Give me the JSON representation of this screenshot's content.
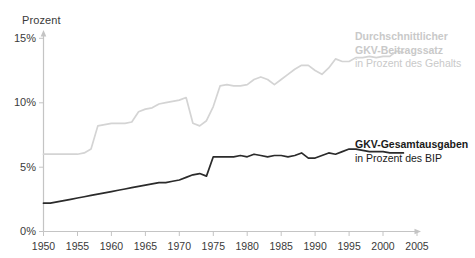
{
  "axes": {
    "y_unit_label": "Prozent",
    "y_ticks": [
      "15%",
      "10%",
      "5%",
      "0%"
    ],
    "x_ticks": [
      "1950",
      "1955",
      "1960",
      "1965",
      "1970",
      "1975",
      "1980",
      "1985",
      "1990",
      "1995",
      "2000",
      "2005"
    ]
  },
  "legend": {
    "gray": {
      "line1": "Durchschnittlicher",
      "line2": "GKV-Beitragssatz",
      "line3": "in Prozent des Gehalts"
    },
    "black": {
      "line1": "GKV-Gesamtausgaben",
      "line2": "in Prozent des BIP"
    }
  },
  "colors": {
    "gray_series": "#d4d4d4",
    "black_series": "#2b2b2b",
    "axis": "#c4c4c4",
    "text": "#3a3a3a"
  },
  "chart_data": {
    "type": "line",
    "title": "",
    "xlabel": "",
    "ylabel": "Prozent",
    "xlim": [
      1950,
      2005
    ],
    "ylim": [
      0,
      15
    ],
    "grid": false,
    "legend_position": "right",
    "x": [
      1950,
      1951,
      1952,
      1953,
      1954,
      1955,
      1956,
      1957,
      1958,
      1959,
      1960,
      1961,
      1962,
      1963,
      1964,
      1965,
      1966,
      1967,
      1968,
      1969,
      1970,
      1971,
      1972,
      1973,
      1974,
      1975,
      1976,
      1977,
      1978,
      1979,
      1980,
      1981,
      1982,
      1983,
      1984,
      1985,
      1986,
      1987,
      1988,
      1989,
      1990,
      1991,
      1992,
      1993,
      1994,
      1995,
      1996,
      1997,
      1998,
      1999,
      2000,
      2001,
      2002,
      2003
    ],
    "series": [
      {
        "name": "Durchschnittlicher GKV-Beitragssatz in Prozent des Gehalts",
        "color": "#d4d4d4",
        "units": "Prozent des Gehalts",
        "values": [
          6.0,
          6.0,
          6.0,
          6.0,
          6.0,
          6.0,
          6.1,
          6.4,
          8.2,
          8.3,
          8.4,
          8.4,
          8.4,
          8.5,
          9.3,
          9.5,
          9.6,
          9.9,
          10.0,
          10.1,
          10.2,
          10.4,
          8.4,
          8.2,
          8.6,
          9.7,
          11.3,
          11.4,
          11.3,
          11.3,
          11.4,
          11.8,
          12.0,
          11.8,
          11.4,
          11.8,
          12.2,
          12.6,
          12.9,
          12.9,
          12.5,
          12.2,
          12.7,
          13.4,
          13.2,
          13.2,
          13.5,
          13.5,
          13.6,
          13.5,
          13.6,
          13.6,
          14.0,
          13.9
        ]
      },
      {
        "name": "GKV-Gesamtausgaben in Prozent des BIP",
        "color": "#2b2b2b",
        "units": "Prozent des BIP",
        "values": [
          2.2,
          2.2,
          2.3,
          2.4,
          2.5,
          2.6,
          2.7,
          2.8,
          2.9,
          3.0,
          3.1,
          3.2,
          3.3,
          3.4,
          3.5,
          3.6,
          3.7,
          3.8,
          3.8,
          3.9,
          4.0,
          4.2,
          4.4,
          4.5,
          4.3,
          5.8,
          5.8,
          5.8,
          5.8,
          5.9,
          5.8,
          6.0,
          5.9,
          5.8,
          5.9,
          5.9,
          5.8,
          5.9,
          6.1,
          5.7,
          5.7,
          5.9,
          6.1,
          6.0,
          6.2,
          6.4,
          6.4,
          6.3,
          6.2,
          6.2,
          6.2,
          6.1,
          6.1,
          6.1
        ]
      }
    ]
  }
}
